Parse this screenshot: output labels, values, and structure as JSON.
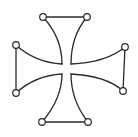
{
  "figure": {
    "width": 138,
    "height": 137,
    "stroke_color": "#2a2a2a",
    "background": "#ffffff",
    "center_gap": {
      "x1": 62,
      "x2": 71,
      "y1": 64,
      "y2": 74
    },
    "nodes": [
      {
        "id": "top-left",
        "cx": 43,
        "cy": 17
      },
      {
        "id": "top-right",
        "cx": 87,
        "cy": 17
      },
      {
        "id": "right-top",
        "cx": 125,
        "cy": 47
      },
      {
        "id": "right-bottom",
        "cx": 123,
        "cy": 91
      },
      {
        "id": "bottom-right",
        "cx": 88,
        "cy": 122
      },
      {
        "id": "bottom-left",
        "cx": 42,
        "cy": 122
      },
      {
        "id": "left-bottom",
        "cx": 16,
        "cy": 93
      },
      {
        "id": "left-top",
        "cx": 16,
        "cy": 45
      }
    ],
    "node_radius": 3.3
  }
}
